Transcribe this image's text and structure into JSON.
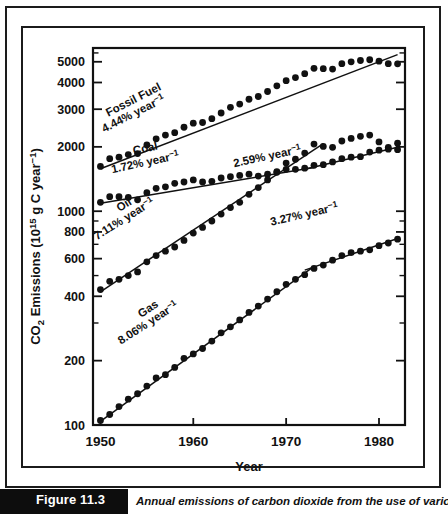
{
  "figure": {
    "tag": "Figure 11.3",
    "caption": "Annual emissions of carbon dioxide from the use of various"
  },
  "chart_data": {
    "type": "scatter",
    "title": "",
    "xlabel": "Year",
    "ylabel": "CO2 Emissions (1015 g C year-1)",
    "ylabel_parts": {
      "prefix": "CO",
      "sub": "2",
      "mid": " Emissions (10",
      "sup1": "15",
      "mid2": " g C year",
      "sup2": "−1",
      "suffix": ")"
    },
    "yscale": "log",
    "xlim": [
      1949.2,
      1982.8
    ],
    "ylim": [
      100,
      5800
    ],
    "grid": false,
    "legend": "inline-annotations",
    "xticks": [
      1950,
      1960,
      1970,
      1980
    ],
    "xticklabels": [
      "1950",
      "1960",
      "1970",
      "1980"
    ],
    "yticks": [
      100,
      200,
      400,
      600,
      800,
      1000,
      2000,
      3000,
      4000,
      5000
    ],
    "yticklabels": [
      "100",
      "200",
      "400",
      "600",
      "800",
      "1000",
      "2000",
      "3000",
      "4000",
      "5000"
    ],
    "yminorticks": [
      300,
      500,
      700,
      900,
      1500,
      2500,
      3500,
      4500,
      5500,
      150,
      250,
      350,
      450
    ],
    "annotations": [
      {
        "id": "fossil-fuel",
        "label": "Fossil Fuel",
        "rate": "4.44% year−1",
        "x": 135,
        "y": 103,
        "rotate": -27
      },
      {
        "id": "coal",
        "label": "Coal",
        "rate": "1.72% year−1",
        "x": 146,
        "y": 152,
        "rotate": -12
      },
      {
        "id": "coal-late",
        "label": "",
        "rate": "2.59% year−1",
        "x": 268,
        "y": 160,
        "rotate": -12
      },
      {
        "id": "oil",
        "label": "Oil",
        "rate": "7.11% year−1",
        "x": 126,
        "y": 208,
        "rotate": -32
      },
      {
        "id": "gas",
        "label": "Gas",
        "rate": "8.06% year−1",
        "x": 150,
        "y": 312,
        "rotate": -33
      },
      {
        "id": "gas-late",
        "label": "",
        "rate": "3.27% year−1",
        "x": 305,
        "y": 218,
        "rotate": -13
      }
    ],
    "series": [
      {
        "name": "Fossil Fuel",
        "growth_rate": "4.44% year−1",
        "x": [
          1950,
          1951,
          1952,
          1953,
          1954,
          1955,
          1956,
          1957,
          1958,
          1959,
          1960,
          1961,
          1962,
          1963,
          1964,
          1965,
          1966,
          1967,
          1968,
          1969,
          1970,
          1971,
          1972,
          1973,
          1974,
          1975,
          1976,
          1977,
          1978,
          1979,
          1980,
          1981,
          1982
        ],
        "y": [
          1620,
          1760,
          1790,
          1840,
          1860,
          2040,
          2180,
          2270,
          2330,
          2470,
          2580,
          2600,
          2710,
          2880,
          3060,
          3170,
          3340,
          3440,
          3630,
          3860,
          4080,
          4220,
          4400,
          4660,
          4640,
          4620,
          4900,
          5000,
          5070,
          5110,
          5030,
          4900,
          4890
        ],
        "fit": {
          "x": [
            1950,
            1982
          ],
          "y": [
            1580,
            5400
          ],
          "type": "exponential"
        }
      },
      {
        "name": "Coal",
        "growth_rate_early": "1.72% year−1",
        "growth_rate_late": "2.59% year−1",
        "x": [
          1950,
          1951,
          1952,
          1953,
          1954,
          1955,
          1956,
          1957,
          1958,
          1959,
          1960,
          1961,
          1962,
          1963,
          1964,
          1965,
          1966,
          1967,
          1968,
          1969,
          1970,
          1971,
          1972,
          1973,
          1974,
          1975,
          1976,
          1977,
          1978,
          1979,
          1980,
          1981,
          1982
        ],
        "y": [
          1100,
          1170,
          1170,
          1160,
          1130,
          1220,
          1280,
          1300,
          1350,
          1370,
          1400,
          1370,
          1380,
          1430,
          1450,
          1470,
          1490,
          1460,
          1490,
          1520,
          1570,
          1570,
          1590,
          1640,
          1650,
          1700,
          1760,
          1790,
          1800,
          1890,
          1930,
          1950,
          1940
        ],
        "fit_early": {
          "x": [
            1950,
            1973
          ],
          "y": [
            1090,
            1600
          ],
          "type": "exponential"
        },
        "fit_late": {
          "x": [
            1972,
            1982
          ],
          "y": [
            1570,
            1990
          ],
          "type": "exponential"
        }
      },
      {
        "name": "Oil",
        "growth_rate": "7.11% year−1",
        "x": [
          1950,
          1951,
          1952,
          1953,
          1954,
          1955,
          1956,
          1957,
          1958,
          1959,
          1960,
          1961,
          1962,
          1963,
          1964,
          1965,
          1966,
          1967,
          1968,
          1969,
          1970,
          1971,
          1972,
          1973,
          1974,
          1975,
          1976,
          1977,
          1978,
          1979,
          1980,
          1981,
          1982
        ],
        "y": [
          430,
          470,
          480,
          500,
          520,
          580,
          620,
          650,
          680,
          730,
          790,
          840,
          900,
          970,
          1040,
          1100,
          1200,
          1290,
          1400,
          1530,
          1680,
          1750,
          1870,
          2060,
          2010,
          1990,
          2130,
          2190,
          2240,
          2270,
          2110,
          1990,
          2080
        ],
        "fit": {
          "x": [
            1950,
            1974
          ],
          "y": [
            420,
            2070
          ],
          "type": "exponential"
        }
      },
      {
        "name": "Gas",
        "growth_rate_early": "8.06% year−1",
        "growth_rate_late": "3.27% year−1",
        "x": [
          1950,
          1951,
          1952,
          1953,
          1954,
          1955,
          1956,
          1957,
          1958,
          1959,
          1960,
          1961,
          1962,
          1963,
          1964,
          1965,
          1966,
          1967,
          1968,
          1969,
          1970,
          1971,
          1972,
          1973,
          1974,
          1975,
          1976,
          1977,
          1978,
          1979,
          1980,
          1981,
          1982
        ],
        "y": [
          105,
          112,
          122,
          132,
          140,
          152,
          166,
          172,
          186,
          205,
          215,
          228,
          247,
          270,
          288,
          310,
          336,
          360,
          388,
          420,
          455,
          480,
          505,
          540,
          560,
          590,
          620,
          640,
          650,
          660,
          690,
          710,
          740
        ],
        "fit_early": {
          "x": [
            1950,
            1973
          ],
          "y": [
            104,
            552
          ],
          "type": "exponential"
        },
        "fit_late": {
          "x": [
            1972,
            1982
          ],
          "y": [
            530,
            745
          ],
          "type": "exponential"
        }
      }
    ]
  }
}
